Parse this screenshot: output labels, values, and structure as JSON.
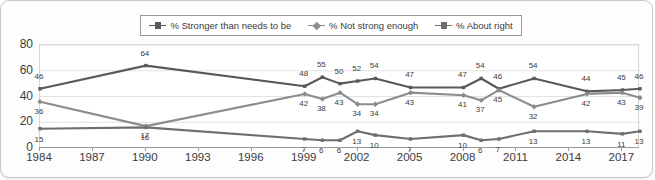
{
  "chart_data": {
    "type": "line",
    "title": "",
    "xlabel": "",
    "ylabel": "",
    "ylim": [
      0,
      80
    ],
    "ytick_labels": [
      "0",
      "20",
      "40",
      "60",
      "80"
    ],
    "xtick_labels": [
      "1984",
      "1987",
      "1990",
      "1993",
      "1996",
      "1999",
      "2002",
      "2005",
      "2008",
      "2011",
      "2014",
      "2017"
    ],
    "xlim": [
      1984,
      2018
    ],
    "grid": "horizontal",
    "legend_position": "top",
    "x": [
      1984,
      1990,
      1999,
      2000,
      2001,
      2002,
      2003,
      2005,
      2008,
      2009,
      2010,
      2012,
      2015,
      2017,
      2018
    ],
    "series": [
      {
        "name": "% Stronger than needs to be",
        "color": "#595959",
        "marker": "square",
        "values": [
          46,
          64,
          48,
          55,
          50,
          52,
          54,
          47,
          47,
          54,
          46,
          54,
          44,
          45,
          46
        ]
      },
      {
        "name": "% Not strong enough",
        "color": "#8c8c8c",
        "marker": "diamond",
        "values": [
          36,
          17,
          42,
          38,
          43,
          34,
          34,
          43,
          41,
          37,
          45,
          32,
          42,
          43,
          39
        ]
      },
      {
        "name": "% About right",
        "color": "#6e6e6e",
        "marker": "square",
        "values": [
          15,
          16,
          7,
          6,
          6,
          13,
          10,
          7,
          10,
          6,
          7,
          13,
          13,
          11,
          13
        ]
      }
    ]
  },
  "legend": {
    "items": [
      {
        "label": "% Stronger than needs to be"
      },
      {
        "label": "% Not strong enough"
      },
      {
        "label": "% About right"
      }
    ]
  }
}
